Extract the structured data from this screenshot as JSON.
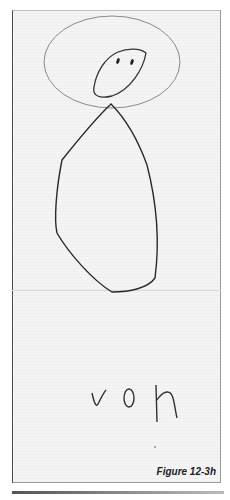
{
  "figure": {
    "caption": "Figure 12-3h",
    "handwritten_text": "voh"
  }
}
